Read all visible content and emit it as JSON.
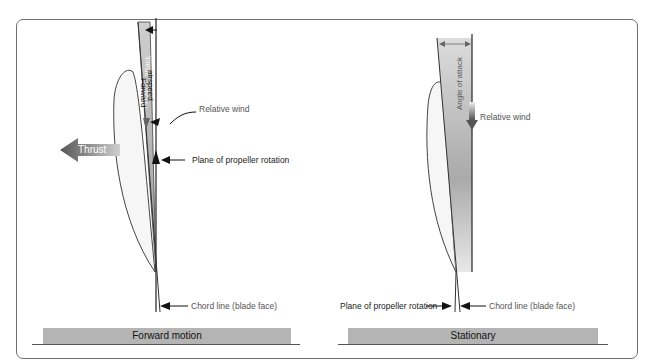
{
  "figure": {
    "panels": [
      {
        "id": "forward-motion",
        "caption": "Forward motion",
        "labels": {
          "angle_of_attack": "Angle of attack",
          "forward_airspeed_line1": "Forward",
          "forward_airspeed_line2": "airspeed",
          "relative_wind": "Relative wind",
          "thrust": "Thrust",
          "plane_of_rotation": "Plane of propeller rotation",
          "chord_line": "Chord line (blade face)"
        }
      },
      {
        "id": "stationary",
        "caption": "Stationary",
        "labels": {
          "angle_of_attack": "Angle of attack",
          "relative_wind": "Relative wind",
          "plane_of_rotation": "Plane of propeller rotation",
          "chord_line": "Chord line (blade face)"
        }
      }
    ],
    "colors": {
      "banner": "#b4b4b4",
      "wedge": "#c8c8c8",
      "line": "#333333",
      "thrust_arrow": "#777777"
    }
  }
}
